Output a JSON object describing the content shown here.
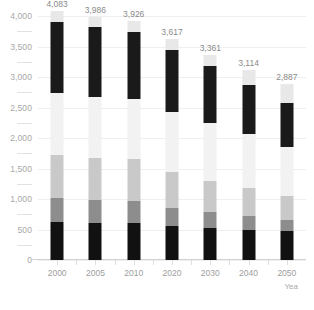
{
  "chart_data": {
    "type": "bar",
    "subtype": "stacked-column",
    "title": "",
    "xlabel": "Yea",
    "ylabel": "",
    "categories": [
      "2000",
      "2005",
      "2010",
      "2020",
      "2030",
      "2040",
      "2050"
    ],
    "totals": [
      4083,
      3986,
      3926,
      3617,
      3361,
      3114,
      2887
    ],
    "data_labels": [
      "4,083",
      "3,986",
      "3,926",
      "3,617",
      "3,361",
      "3,114",
      "2,887"
    ],
    "ylim": [
      0,
      4000
    ],
    "ytick_values": [
      0,
      500,
      1000,
      1500,
      2000,
      2500,
      3000,
      3500,
      4000
    ],
    "ytick_labels": [
      "0",
      "500",
      "1,000",
      "1,500",
      "2,000",
      "2,500",
      "3,000",
      "3,500",
      "4,000"
    ],
    "grid": true,
    "grid_axis": "y",
    "legend": "none",
    "series": [
      {
        "name": "segment-1-bottom",
        "color": "#111111",
        "values": [
          620,
          605,
          600,
          560,
          520,
          500,
          470
        ]
      },
      {
        "name": "segment-2",
        "color": "#8d8d8d",
        "values": [
          390,
          380,
          375,
          290,
          260,
          225,
          190
        ]
      },
      {
        "name": "segment-3",
        "color": "#c9c9c9",
        "values": [
          705,
          690,
          680,
          590,
          520,
          460,
          390
        ]
      },
      {
        "name": "segment-4",
        "color": "#f2f2f2",
        "values": [
          1030,
          1000,
          980,
          990,
          950,
          880,
          810
        ]
      },
      {
        "name": "segment-5",
        "color": "#1a1a1a",
        "values": [
          1150,
          1140,
          1100,
          1010,
          930,
          800,
          720
        ]
      },
      {
        "name": "segment-6-top",
        "color": "#e8e8e8",
        "values": [
          188,
          171,
          191,
          177,
          181,
          249,
          307
        ]
      }
    ]
  },
  "colors": {
    "gridline": "#efefef",
    "axis": "#d2d2d2",
    "tick_text": "#a8a8a8",
    "label_text": "#8a8a8a",
    "background": "#ffffff"
  }
}
